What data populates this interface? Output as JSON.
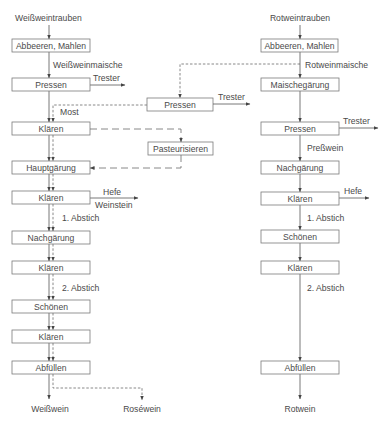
{
  "white_wine": {
    "input_label": "Weißweintrauben",
    "boxes": [
      "Abbeeren, Mahlen",
      "Pressen",
      "Klären",
      "Hauptgärung",
      "Klären",
      "Nachgärung",
      "Klären",
      "Schönen",
      "Klären",
      "Abfüllen"
    ],
    "flow_labels": {
      "maische": "Weißweinmaische",
      "most": "Most",
      "abstich1": "1. Abstich",
      "abstich2": "2. Abstich"
    },
    "side_outputs": {
      "trester": "Trester",
      "hefe": "Hefe",
      "weinstein": "Weinstein"
    },
    "outputs": {
      "white": "Weißwein",
      "rose": "Roséwein"
    }
  },
  "rose_branch": {
    "boxes": [
      "Pressen",
      "Pasteurisieren"
    ],
    "trester": "Trester"
  },
  "red_wine": {
    "input_label": "Rotweintrauben",
    "boxes": [
      "Abbeeren, Mahlen",
      "Maischegärung",
      "Pressen",
      "Nachgärung",
      "Klären",
      "Schönen",
      "Klären",
      "Abfüllen"
    ],
    "flow_labels": {
      "maische": "Rotweinmaische",
      "presswein": "Preßwein",
      "abstich1": "1. Abstich",
      "abstich2": "2. Abstich"
    },
    "side_outputs": {
      "trester": "Trester",
      "hefe": "Hefe"
    },
    "output": "Rotwein"
  },
  "legend_colors": {
    "line": "#555555",
    "box_border": "#7a7a7a",
    "text": "#4a4a4a",
    "background": "#ffffff"
  }
}
